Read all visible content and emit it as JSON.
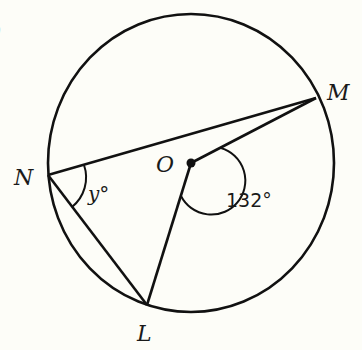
{
  "diagram": {
    "title": "",
    "partial_label": ")",
    "circle": {
      "center_label": "O"
    },
    "points": {
      "N": {
        "label": "N"
      },
      "M": {
        "label": "M"
      },
      "L": {
        "label": "L"
      },
      "O": {
        "label": "O"
      }
    },
    "angles": {
      "MNL": {
        "label": "y°",
        "var": "y"
      },
      "MOL": {
        "label": "132°",
        "value": 132
      }
    },
    "segments": [
      "NM",
      "NL",
      "OM",
      "OL"
    ]
  }
}
